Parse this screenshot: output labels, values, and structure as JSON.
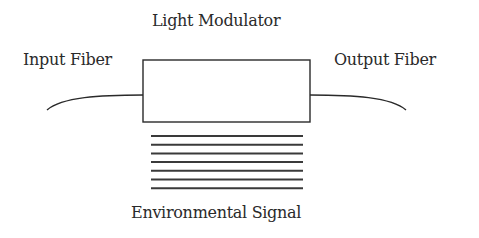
{
  "diagram": {
    "labels": {
      "modulator": "Light Modulator",
      "input": "Input Fiber",
      "output": "Output Fiber",
      "signal": "Environmental Signal"
    },
    "colors": {
      "stroke": "#2a2a2a",
      "signal_lines": "#3a3a3a",
      "background": "#ffffff"
    },
    "signal_line_count": 7
  }
}
